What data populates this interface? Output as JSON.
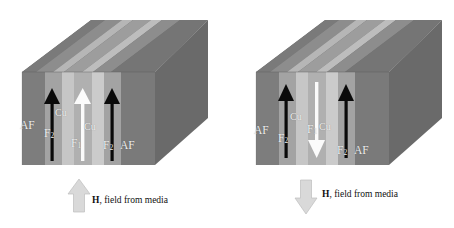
{
  "figure": {
    "panels": [
      {
        "id": "parallel-state",
        "name": "left-panel",
        "layers": [
          {
            "id": "af-left",
            "label": "AF",
            "kind": "antiferromagnet",
            "color": "#7d7d7d"
          },
          {
            "id": "f2-left",
            "label": "F",
            "sub": "2",
            "kind": "ferromagnet",
            "color": "#a3a3a3"
          },
          {
            "id": "cu-left",
            "label": "Cu",
            "kind": "spacer",
            "color": "#c8c8c8"
          },
          {
            "id": "f1",
            "label": "F",
            "sub": "1",
            "kind": "free-layer",
            "color": "#b5b5b5"
          },
          {
            "id": "cu-right",
            "label": "Cu",
            "kind": "spacer",
            "color": "#c8c8c8"
          },
          {
            "id": "f2-right",
            "label": "F",
            "sub": "2",
            "kind": "ferromagnet",
            "color": "#a3a3a3"
          },
          {
            "id": "af-right",
            "label": "AF",
            "kind": "antiferromagnet",
            "color": "#7d7d7d"
          }
        ],
        "arrows": [
          {
            "id": "m-f2-left",
            "direction": "up",
            "color": "#0a0a0a",
            "layer": "f2-left"
          },
          {
            "id": "m-f1",
            "direction": "up",
            "color": "#fbfbfb",
            "layer": "f1"
          },
          {
            "id": "m-f2-right",
            "direction": "up",
            "color": "#0a0a0a",
            "layer": "f2-right"
          }
        ],
        "field": {
          "direction": "up",
          "arrow_color": "#d6d6d6",
          "symbol": "H",
          "caption": ", field from media"
        }
      },
      {
        "id": "antiparallel-state",
        "name": "right-panel",
        "layers": [
          {
            "id": "af-left",
            "label": "AF",
            "kind": "antiferromagnet",
            "color": "#7d7d7d"
          },
          {
            "id": "f2-left",
            "label": "F",
            "sub": "2",
            "kind": "ferromagnet",
            "color": "#a3a3a3"
          },
          {
            "id": "cu-left",
            "label": "Cu",
            "kind": "spacer",
            "color": "#c8c8c8"
          },
          {
            "id": "f1",
            "label": "F",
            "sub": "1",
            "kind": "free-layer",
            "color": "#b5b5b5"
          },
          {
            "id": "cu-right",
            "label": "Cu",
            "kind": "spacer",
            "color": "#c8c8c8"
          },
          {
            "id": "f2-right",
            "label": "F",
            "sub": "2",
            "kind": "ferromagnet",
            "color": "#a3a3a3"
          },
          {
            "id": "af-right",
            "label": "AF",
            "kind": "antiferromagnet",
            "color": "#7d7d7d"
          }
        ],
        "arrows": [
          {
            "id": "m-f2-left",
            "direction": "up",
            "color": "#0a0a0a",
            "layer": "f2-left"
          },
          {
            "id": "m-f1",
            "direction": "down",
            "color": "#fbfbfb",
            "layer": "f1"
          },
          {
            "id": "m-f2-right",
            "direction": "up",
            "color": "#0a0a0a",
            "layer": "f2-right"
          }
        ],
        "field": {
          "direction": "down",
          "arrow_color": "#d6d6d6",
          "symbol": "H",
          "caption": ", field from media"
        }
      }
    ],
    "palette": {
      "af_front": "#7d7d7d",
      "f_front": "#a5a5a5",
      "cu_front": "#cacaca",
      "top_dark": "#6f6f6f",
      "top_light": "#b6b6b6",
      "side_face": "#6a6a6a",
      "arrow_black": "#0a0a0a",
      "arrow_white": "#fbfbfb",
      "field_arrow": "#d6d6d6",
      "background": "#ffffff"
    }
  }
}
